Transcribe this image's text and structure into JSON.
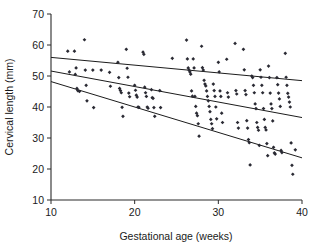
{
  "chart_data": {
    "type": "scatter",
    "title": "",
    "xlabel": "Gestational age (weeks)",
    "ylabel": "Cervical length (mm)",
    "xlim": [
      10,
      40
    ],
    "ylim": [
      10,
      70
    ],
    "xticks": [
      10,
      20,
      30,
      40
    ],
    "yticks": [
      10,
      20,
      30,
      40,
      50,
      60,
      70
    ],
    "xtick_labels": [
      "10",
      "20",
      "30",
      "40"
    ],
    "ytick_labels": [
      "10",
      "20",
      "30",
      "40",
      "50",
      "60",
      "70"
    ],
    "grid": false,
    "legend": "none",
    "marker": "diamond",
    "marker_color": "#2a2a33",
    "line_color": "#1c1c1c",
    "axis_color": "#2b2b2b",
    "series": [
      {
        "name": "Cervical length measurements",
        "type": "scatter",
        "points": [
          [
            12.0,
            58.0
          ],
          [
            12.2,
            51.3
          ],
          [
            12.8,
            58.0
          ],
          [
            12.9,
            50.5
          ],
          [
            13.0,
            52.6
          ],
          [
            13.1,
            46.0
          ],
          [
            13.2,
            45.3
          ],
          [
            13.4,
            45.0
          ],
          [
            14.0,
            61.7
          ],
          [
            14.1,
            51.9
          ],
          [
            14.2,
            47.0
          ],
          [
            14.3,
            42.0
          ],
          [
            15.0,
            51.9
          ],
          [
            15.1,
            39.8
          ],
          [
            16.0,
            51.9
          ],
          [
            17.0,
            51.2
          ],
          [
            17.1,
            46.7
          ],
          [
            18.0,
            54.4
          ],
          [
            18.1,
            49.5
          ],
          [
            18.2,
            46.0
          ],
          [
            18.3,
            45.3
          ],
          [
            18.4,
            44.6
          ],
          [
            18.5,
            39.9
          ],
          [
            18.6,
            37.0
          ],
          [
            19.0,
            58.6
          ],
          [
            19.1,
            52.5
          ],
          [
            19.2,
            49.6
          ],
          [
            19.3,
            44.5
          ],
          [
            19.4,
            43.3
          ],
          [
            20.0,
            47.0
          ],
          [
            20.1,
            45.4
          ],
          [
            20.2,
            43.8
          ],
          [
            20.3,
            43.2
          ],
          [
            20.4,
            40.0
          ],
          [
            20.5,
            39.9
          ],
          [
            21.0,
            57.7
          ],
          [
            21.1,
            57.0
          ],
          [
            21.2,
            46.4
          ],
          [
            21.3,
            44.6
          ],
          [
            21.4,
            43.4
          ],
          [
            21.5,
            40.0
          ],
          [
            21.6,
            39.6
          ],
          [
            22.0,
            45.6
          ],
          [
            22.1,
            43.0
          ],
          [
            22.2,
            42.8
          ],
          [
            22.3,
            39.8
          ],
          [
            22.4,
            37.0
          ],
          [
            23.0,
            45.3
          ],
          [
            23.1,
            39.8
          ],
          [
            24.5,
            55.7
          ],
          [
            26.2,
            61.6
          ],
          [
            26.3,
            55.5
          ],
          [
            26.4,
            52.6
          ],
          [
            26.5,
            51.9
          ],
          [
            26.6,
            51.3
          ],
          [
            26.7,
            50.6
          ],
          [
            26.8,
            45.2
          ],
          [
            26.9,
            43.5
          ],
          [
            27.0,
            55.5
          ],
          [
            27.1,
            52.6
          ],
          [
            27.2,
            43.4
          ],
          [
            27.3,
            40.2
          ],
          [
            27.4,
            38.0
          ],
          [
            27.5,
            37.2
          ],
          [
            27.6,
            34.6
          ],
          [
            27.7,
            30.6
          ],
          [
            28.0,
            59.6
          ],
          [
            28.1,
            52.7
          ],
          [
            28.2,
            51.9
          ],
          [
            28.3,
            48.6
          ],
          [
            28.4,
            47.4
          ],
          [
            28.5,
            46.8
          ],
          [
            28.6,
            45.2
          ],
          [
            28.7,
            43.4
          ],
          [
            28.8,
            42.0
          ],
          [
            28.9,
            40.2
          ],
          [
            29.0,
            38.5
          ],
          [
            29.1,
            36.0
          ],
          [
            29.2,
            34.6
          ],
          [
            29.3,
            33.0
          ],
          [
            29.4,
            47.4
          ],
          [
            29.5,
            45.3
          ],
          [
            29.6,
            43.4
          ],
          [
            29.7,
            40.0
          ],
          [
            29.8,
            36.2
          ],
          [
            30.0,
            54.4
          ],
          [
            30.1,
            51.3
          ],
          [
            30.2,
            45.2
          ],
          [
            30.3,
            43.4
          ],
          [
            30.4,
            38.0
          ],
          [
            30.5,
            35.0
          ],
          [
            31.0,
            55.4
          ],
          [
            31.1,
            44.6
          ],
          [
            31.2,
            43.2
          ],
          [
            32.0,
            60.5
          ],
          [
            32.1,
            45.3
          ],
          [
            32.2,
            44.2
          ],
          [
            32.3,
            35.0
          ],
          [
            32.4,
            33.2
          ],
          [
            33.0,
            58.6
          ],
          [
            33.1,
            52.0
          ],
          [
            33.2,
            45.3
          ],
          [
            33.3,
            44.0
          ],
          [
            33.4,
            35.6
          ],
          [
            33.5,
            33.2
          ],
          [
            33.6,
            29.5
          ],
          [
            33.7,
            28.5
          ],
          [
            33.8,
            21.3
          ],
          [
            34.0,
            50.0
          ],
          [
            34.1,
            49.5
          ],
          [
            34.2,
            47.0
          ],
          [
            34.3,
            44.6
          ],
          [
            34.4,
            41.0
          ],
          [
            34.5,
            39.5
          ],
          [
            34.6,
            35.0
          ],
          [
            34.7,
            33.4
          ],
          [
            34.8,
            32.5
          ],
          [
            34.9,
            27.6
          ],
          [
            35.0,
            52.0
          ],
          [
            35.1,
            49.6
          ],
          [
            35.2,
            47.0
          ],
          [
            35.3,
            44.6
          ],
          [
            35.4,
            39.5
          ],
          [
            35.5,
            36.0
          ],
          [
            35.6,
            33.4
          ],
          [
            35.7,
            32.6
          ],
          [
            35.8,
            28.2
          ],
          [
            35.9,
            24.3
          ],
          [
            36.0,
            53.2
          ],
          [
            36.1,
            49.5
          ],
          [
            36.2,
            44.5
          ],
          [
            36.3,
            41.0
          ],
          [
            36.4,
            39.5
          ],
          [
            36.5,
            35.5
          ],
          [
            36.6,
            27.0
          ],
          [
            36.7,
            25.2
          ],
          [
            36.8,
            24.8
          ],
          [
            37.0,
            49.5
          ],
          [
            37.1,
            47.2
          ],
          [
            37.2,
            44.5
          ],
          [
            37.3,
            42.6
          ],
          [
            37.4,
            40.2
          ],
          [
            37.5,
            26.0
          ],
          [
            37.6,
            25.3
          ],
          [
            38.0,
            57.3
          ],
          [
            38.1,
            49.6
          ],
          [
            38.2,
            47.0
          ],
          [
            38.3,
            44.4
          ],
          [
            38.4,
            43.2
          ],
          [
            38.5,
            41.6
          ],
          [
            38.6,
            40.0
          ],
          [
            38.7,
            28.4
          ],
          [
            38.8,
            21.2
          ],
          [
            38.9,
            18.3
          ],
          [
            39.2,
            26.2
          ]
        ]
      }
    ],
    "trend_lines": [
      {
        "name": "upper-percentile-line",
        "x": [
          10,
          40
        ],
        "y": [
          56.0,
          48.5
        ]
      },
      {
        "name": "median-line",
        "x": [
          10,
          40
        ],
        "y": [
          51.6,
          36.6
        ]
      },
      {
        "name": "lower-percentile-line",
        "x": [
          10,
          40
        ],
        "y": [
          48.2,
          23.6
        ]
      }
    ]
  }
}
